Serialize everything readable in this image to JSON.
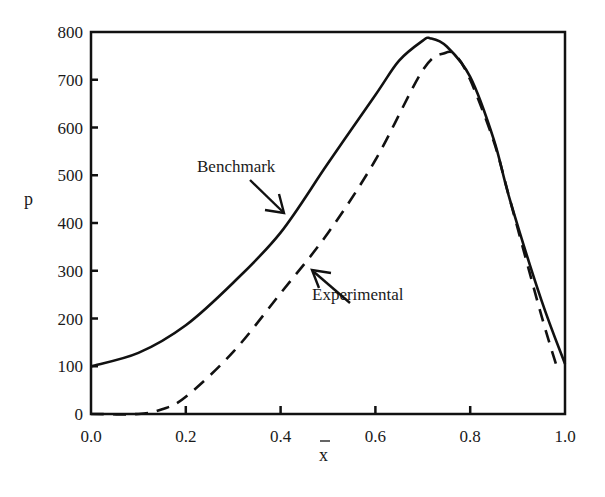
{
  "chart_data": {
    "type": "line",
    "title": "",
    "xlabel": "x̄",
    "ylabel": "p",
    "xlim": [
      0.0,
      1.0
    ],
    "ylim": [
      0,
      800
    ],
    "grid": false,
    "legend": "none (inline annotations with arrows)",
    "x_ticks": [
      "0.0",
      "0.2",
      "0.4",
      "0.6",
      "0.8",
      "1.0"
    ],
    "y_ticks": [
      "0",
      "100",
      "200",
      "300",
      "400",
      "500",
      "600",
      "700",
      "800"
    ],
    "series": [
      {
        "name": "Benchmark",
        "style": "solid",
        "x": [
          0.0,
          0.1,
          0.2,
          0.3,
          0.4,
          0.5,
          0.6,
          0.65,
          0.7,
          0.715,
          0.75,
          0.8,
          0.85,
          0.884,
          0.95,
          1.0
        ],
        "y": [
          100,
          128,
          186,
          275,
          380,
          525,
          668,
          740,
          782,
          787,
          770,
          706,
          574,
          448,
          239,
          105
        ]
      },
      {
        "name": "Experimental",
        "style": "dashed",
        "x": [
          0.0,
          0.1,
          0.15,
          0.2,
          0.3,
          0.4,
          0.5,
          0.6,
          0.7,
          0.747,
          0.77,
          0.8,
          0.85,
          0.884,
          0.95,
          0.985
        ],
        "y": [
          0,
          0,
          10,
          36,
          130,
          253,
          379,
          532,
          720,
          756,
          750,
          700,
          570,
          448,
          207,
          92
        ]
      }
    ],
    "annotations": [
      {
        "text": "Benchmark",
        "target_series": "Benchmark"
      },
      {
        "text": "Experimental",
        "target_series": "Experimental"
      }
    ]
  },
  "labels": {
    "benchmark": "Benchmark",
    "experimental": "Experimental",
    "y_axis": "p",
    "x_axis": "x"
  }
}
